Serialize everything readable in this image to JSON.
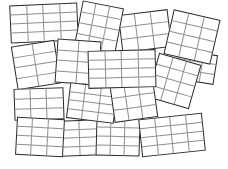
{
  "scene": {
    "title": "Scattered blank grid cards",
    "width": 228,
    "height": 169,
    "background_color": "#ffffff",
    "card_border_color": "#2b2b2b",
    "grid_line_color": "#8e8e8e",
    "card_fill_color": "#ffffff",
    "card_count": 16
  },
  "cards": [
    {
      "id": "card-1",
      "label": "grid card 1",
      "x": 10,
      "y": 4,
      "w": 68,
      "h": 38,
      "rotate": -2.5,
      "cols": 4,
      "rows": 4,
      "z": 3
    },
    {
      "id": "card-2",
      "label": "grid card 2",
      "x": 78,
      "y": 4,
      "w": 42,
      "h": 46,
      "rotate": 11,
      "cols": 3,
      "rows": 4,
      "z": 4
    },
    {
      "id": "card-3",
      "label": "grid card 3",
      "x": 120,
      "y": 12,
      "w": 50,
      "h": 38,
      "rotate": -7,
      "cols": 3,
      "rows": 3,
      "z": 3
    },
    {
      "id": "card-4",
      "label": "grid card 4",
      "x": 168,
      "y": 14,
      "w": 48,
      "h": 46,
      "rotate": 13,
      "cols": 3,
      "rows": 4,
      "z": 5
    },
    {
      "id": "card-5",
      "label": "grid card 5",
      "x": 14,
      "y": 43,
      "w": 44,
      "h": 44,
      "rotate": -9,
      "cols": 2,
      "rows": 4,
      "z": 4
    },
    {
      "id": "card-6",
      "label": "grid card 6",
      "x": 56,
      "y": 40,
      "w": 44,
      "h": 44,
      "rotate": 4,
      "cols": 2,
      "rows": 4,
      "z": 5
    },
    {
      "id": "card-7",
      "label": "grid card 7",
      "x": 88,
      "y": 50,
      "w": 68,
      "h": 38,
      "rotate": -1.5,
      "cols": 4,
      "rows": 4,
      "z": 7
    },
    {
      "id": "card-8",
      "label": "grid card 8",
      "x": 152,
      "y": 58,
      "w": 44,
      "h": 46,
      "rotate": 16,
      "cols": 3,
      "rows": 4,
      "z": 6
    },
    {
      "id": "card-9",
      "label": "grid card 9",
      "x": 14,
      "y": 88,
      "w": 50,
      "h": 32,
      "rotate": -2,
      "cols": 3,
      "rows": 3,
      "z": 4
    },
    {
      "id": "card-10",
      "label": "grid card 10",
      "x": 68,
      "y": 85,
      "w": 48,
      "h": 36,
      "rotate": 7,
      "cols": 3,
      "rows": 4,
      "z": 6
    },
    {
      "id": "card-11",
      "label": "grid card 11",
      "x": 112,
      "y": 84,
      "w": 44,
      "h": 36,
      "rotate": -8,
      "cols": 3,
      "rows": 3,
      "z": 6
    },
    {
      "id": "card-12",
      "label": "grid card 12",
      "x": 16,
      "y": 118,
      "w": 48,
      "h": 38,
      "rotate": 3,
      "cols": 3,
      "rows": 4,
      "z": 5
    },
    {
      "id": "card-13",
      "label": "grid card 13",
      "x": 60,
      "y": 120,
      "w": 40,
      "h": 36,
      "rotate": -2,
      "cols": 2,
      "rows": 4,
      "z": 4
    },
    {
      "id": "card-14",
      "label": "grid card 14",
      "x": 96,
      "y": 118,
      "w": 44,
      "h": 38,
      "rotate": 1.5,
      "cols": 3,
      "rows": 4,
      "z": 5
    },
    {
      "id": "card-15",
      "label": "grid card 15",
      "x": 140,
      "y": 116,
      "w": 64,
      "h": 38,
      "rotate": -6,
      "cols": 4,
      "rows": 4,
      "z": 6
    },
    {
      "id": "card-16",
      "label": "grid card 16",
      "x": 176,
      "y": 52,
      "w": 40,
      "h": 30,
      "rotate": 9,
      "cols": 3,
      "rows": 3,
      "z": 2
    }
  ]
}
